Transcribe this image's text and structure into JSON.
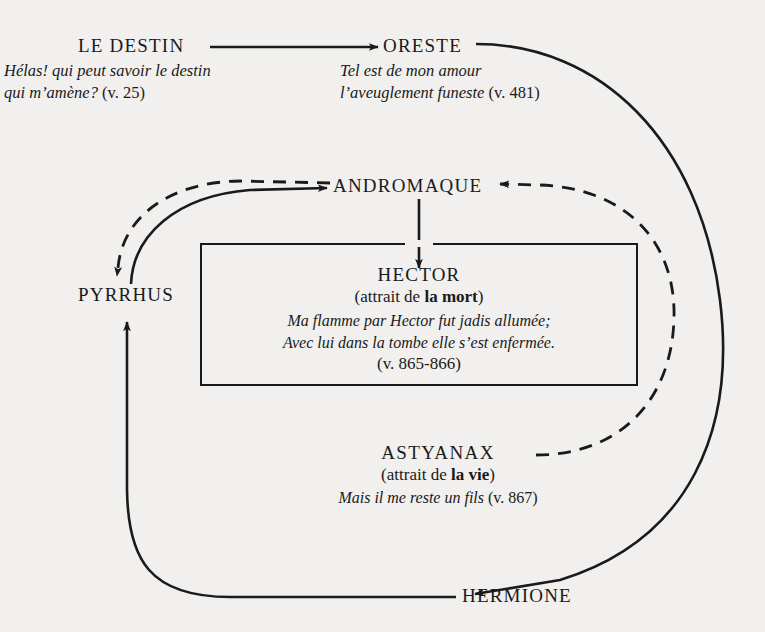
{
  "diagram": {
    "background_color": "#f1f0ee",
    "ink_color": "#1a1a1a",
    "nodes": {
      "destin": {
        "name": "LE DESTIN",
        "quote_line1": "Hélas! qui peut savoir le destin",
        "quote_line2": "qui m’amène?",
        "quote_ref": " (v. 25)"
      },
      "oreste": {
        "name": "ORESTE",
        "quote_line1": "Tel est de mon amour",
        "quote_line2": "l’aveuglement funeste",
        "quote_ref": " (v. 481)"
      },
      "andromaque": {
        "name": "ANDROMAQUE"
      },
      "pyrrhus": {
        "name": "PYRRHUS"
      },
      "hermione": {
        "name": "HERMIONE"
      },
      "hector": {
        "name": "HECTOR",
        "sub_prefix": "(attrait de ",
        "sub_strong": "la mort",
        "sub_suffix": ")",
        "quote_line1": "Ma flamme par Hector fut jadis allumée;",
        "quote_line2": "Avec lui dans la tombe elle s’est enfermée.",
        "quote_ref": "(v. 865-866)"
      },
      "astyanax": {
        "name": "ASTYANAX",
        "sub_prefix": "(attrait de ",
        "sub_strong": "la vie",
        "sub_suffix": ")",
        "quote_line1": "Mais il me reste un fils",
        "quote_ref": " (v. 867)"
      }
    },
    "edges": [
      {
        "id": "destin-to-oreste",
        "from": "LE DESTIN",
        "to": "ORESTE",
        "style": "solid",
        "arrow": "to"
      },
      {
        "id": "oreste-to-hermione",
        "from": "ORESTE",
        "to": "HERMIONE",
        "style": "solid",
        "arrow": "to"
      },
      {
        "id": "hermione-to-pyrrhus",
        "from": "HERMIONE",
        "to": "PYRRHUS",
        "style": "solid",
        "arrow": "to"
      },
      {
        "id": "pyrrhus-to-andromaque",
        "from": "PYRRHUS",
        "to": "ANDROMAQUE",
        "style": "solid",
        "arrow": "to"
      },
      {
        "id": "andromaque-to-hector",
        "from": "ANDROMAQUE",
        "to": "HECTOR",
        "style": "solid",
        "arrow": "to"
      },
      {
        "id": "andromaque-to-pyrrhus",
        "from": "ANDROMAQUE",
        "to": "PYRRHUS",
        "style": "dashed",
        "arrow": "to"
      },
      {
        "id": "astyanax-to-andromaque",
        "from": "ASTYANAX",
        "to": "ANDROMAQUE",
        "style": "dashed",
        "arrow": "to"
      }
    ]
  }
}
